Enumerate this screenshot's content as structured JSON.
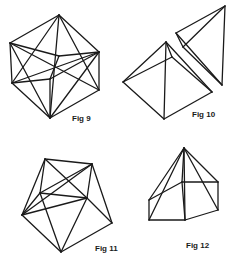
{
  "figures": [
    {
      "label": "Fig 9",
      "label_pos": [
        72,
        114
      ],
      "vertices": [
        [
          59,
          15
        ],
        [
          10,
          43
        ],
        [
          99,
          52
        ],
        [
          12,
          83
        ],
        [
          99,
          90
        ],
        [
          50,
          118
        ],
        [
          50,
          79
        ],
        [
          59,
          56
        ]
      ],
      "edges": [
        [
          0,
          1
        ],
        [
          0,
          2
        ],
        [
          0,
          5
        ],
        [
          0,
          3
        ],
        [
          0,
          4
        ],
        [
          1,
          3
        ],
        [
          1,
          7
        ],
        [
          1,
          4
        ],
        [
          1,
          5
        ],
        [
          2,
          4
        ],
        [
          2,
          7
        ],
        [
          2,
          5
        ],
        [
          2,
          3
        ],
        [
          3,
          5
        ],
        [
          4,
          5
        ],
        [
          5,
          6
        ],
        [
          6,
          3
        ],
        [
          6,
          2
        ],
        [
          7,
          6
        ]
      ]
    },
    {
      "label": "Fig 10",
      "label_pos": [
        192,
        110
      ],
      "vertices": [
        [
          166,
          42
        ],
        [
          123,
          82
        ],
        [
          164,
          119
        ],
        [
          212,
          92
        ],
        [
          172,
          57
        ],
        [
          225,
          6
        ],
        [
          176,
          33
        ],
        [
          183,
          47
        ],
        [
          222,
          85
        ]
      ],
      "edges": [
        [
          0,
          1
        ],
        [
          0,
          2
        ],
        [
          0,
          3
        ],
        [
          1,
          2
        ],
        [
          2,
          3
        ],
        [
          1,
          4
        ],
        [
          0,
          4
        ],
        [
          4,
          3
        ],
        [
          5,
          6
        ],
        [
          5,
          7
        ],
        [
          5,
          8
        ],
        [
          6,
          7
        ],
        [
          7,
          8
        ],
        [
          6,
          8
        ]
      ]
    },
    {
      "label": "Fig 11",
      "label_pos": [
        95,
        244
      ],
      "vertices": [
        [
          45,
          159
        ],
        [
          92,
          164
        ],
        [
          40,
          193
        ],
        [
          87,
          198
        ],
        [
          22,
          215
        ],
        [
          112,
          223
        ],
        [
          61,
          252
        ]
      ],
      "edges": [
        [
          0,
          1
        ],
        [
          0,
          2
        ],
        [
          0,
          4
        ],
        [
          0,
          3
        ],
        [
          1,
          3
        ],
        [
          1,
          5
        ],
        [
          1,
          2
        ],
        [
          1,
          4
        ],
        [
          2,
          3
        ],
        [
          2,
          4
        ],
        [
          2,
          6
        ],
        [
          3,
          5
        ],
        [
          3,
          6
        ],
        [
          4,
          6
        ],
        [
          5,
          6
        ],
        [
          3,
          4
        ]
      ]
    },
    {
      "label": "Fig 12",
      "label_pos": [
        186,
        241
      ],
      "vertices": [
        [
          184,
          148
        ],
        [
          182,
          182
        ],
        [
          218,
          182
        ],
        [
          218,
          210
        ],
        [
          185,
          220
        ],
        [
          149,
          220
        ],
        [
          149,
          200
        ]
      ],
      "edges": [
        [
          0,
          1
        ],
        [
          0,
          2
        ],
        [
          0,
          3
        ],
        [
          0,
          4
        ],
        [
          0,
          5
        ],
        [
          0,
          6
        ],
        [
          1,
          2
        ],
        [
          2,
          3
        ],
        [
          3,
          4
        ],
        [
          4,
          5
        ],
        [
          5,
          6
        ],
        [
          6,
          1
        ],
        [
          1,
          4
        ]
      ]
    }
  ]
}
